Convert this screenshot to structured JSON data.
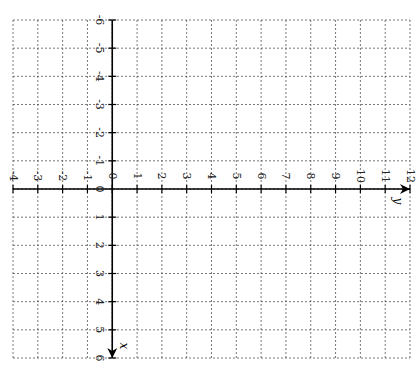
{
  "chart_data": {
    "type": "line",
    "title": "",
    "rotation_deg": 90,
    "horizontal_axis": {
      "name": "y",
      "range": [
        -4,
        12
      ],
      "ticks": [
        -4,
        -3,
        -2,
        -1,
        0,
        1,
        2,
        3,
        4,
        5,
        6,
        7,
        8,
        9,
        10,
        11,
        12
      ],
      "tick_labels": [
        "-4",
        "-3",
        "-2",
        "-1",
        "0",
        "1",
        "2",
        "3",
        "4",
        "5",
        "6",
        "7",
        "8",
        "9",
        "10",
        "11",
        "12"
      ],
      "arrow_direction": "right"
    },
    "vertical_axis": {
      "name": "x",
      "range": [
        -6,
        6
      ],
      "ticks": [
        -6,
        -5,
        -4,
        -3,
        -2,
        -1,
        0,
        1,
        2,
        3,
        4,
        5,
        6
      ],
      "tick_labels": [
        "-6",
        "-5",
        "-4",
        "-3",
        "-2",
        "-1",
        "0",
        "1",
        "2",
        "3",
        "4",
        "5",
        "6"
      ],
      "arrow_direction": "down"
    },
    "grid": true,
    "grid_style": "dashed",
    "series": []
  },
  "layout": {
    "left": 13,
    "right": 410,
    "top": 20,
    "bottom": 358
  }
}
